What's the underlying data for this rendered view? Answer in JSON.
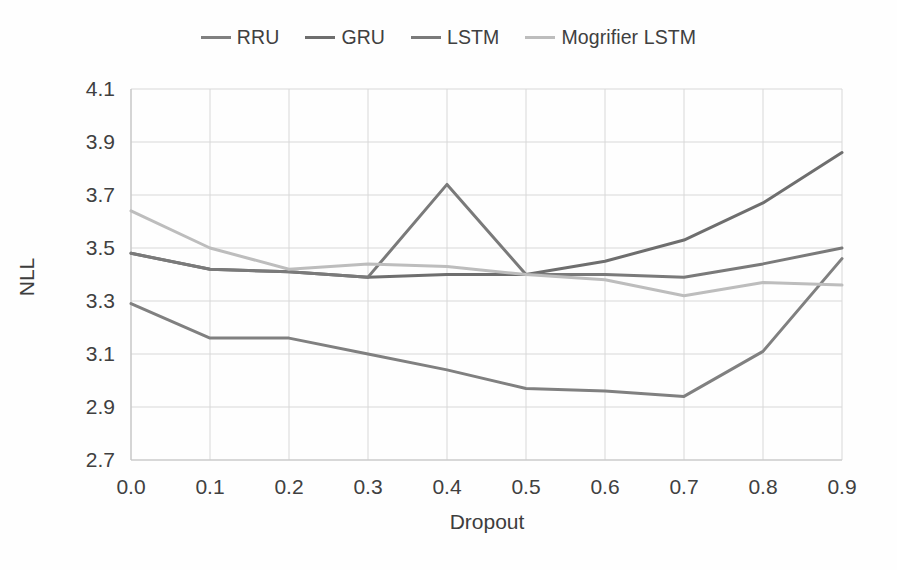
{
  "chart_data": {
    "type": "line",
    "title": "",
    "xlabel": "Dropout",
    "ylabel": "NLL",
    "x": [
      0.0,
      0.1,
      0.2,
      0.3,
      0.4,
      0.5,
      0.6,
      0.7,
      0.8,
      0.9
    ],
    "xtick_labels": [
      "0.0",
      "0.1",
      "0.2",
      "0.3",
      "0.4",
      "0.5",
      "0.6",
      "0.7",
      "0.8",
      "0.9"
    ],
    "ytick_labels": [
      "2.7",
      "2.9",
      "3.1",
      "3.3",
      "3.5",
      "3.7",
      "3.9",
      "4.1"
    ],
    "yticks": [
      2.7,
      2.9,
      3.1,
      3.3,
      3.5,
      3.7,
      3.9,
      4.1
    ],
    "ylim": [
      2.7,
      4.1
    ],
    "xlim": [
      0.0,
      0.9
    ],
    "grid": true,
    "legend_position": "top-center",
    "series": [
      {
        "name": "RRU",
        "color": "#808080",
        "values": [
          3.29,
          3.16,
          3.16,
          3.1,
          3.04,
          2.97,
          2.96,
          2.94,
          3.11,
          3.46
        ]
      },
      {
        "name": "GRU",
        "color": "#6e6e6e",
        "values": [
          3.48,
          3.42,
          3.41,
          3.39,
          3.4,
          3.4,
          3.45,
          3.53,
          3.67,
          3.86
        ]
      },
      {
        "name": "LSTM",
        "color": "#7a7a7a",
        "values": [
          3.48,
          3.42,
          3.41,
          3.39,
          3.74,
          3.4,
          3.4,
          3.39,
          3.44,
          3.5
        ]
      },
      {
        "name": "Mogrifier LSTM",
        "color": "#bdbdbd",
        "values": [
          3.64,
          3.5,
          3.42,
          3.44,
          3.43,
          3.4,
          3.38,
          3.32,
          3.37,
          3.36
        ]
      }
    ]
  },
  "legend": {
    "entries": [
      {
        "label": "RRU"
      },
      {
        "label": "GRU"
      },
      {
        "label": "LSTM"
      },
      {
        "label": "Mogrifier LSTM"
      }
    ]
  },
  "axes": {
    "x_title": "Dropout",
    "y_title": "NLL"
  }
}
